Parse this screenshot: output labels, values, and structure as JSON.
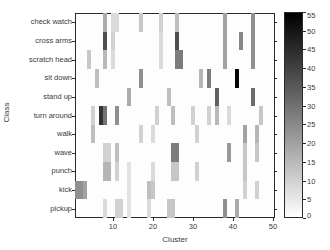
{
  "figure": {
    "xlabel": "Cluster",
    "ylabel": "Class"
  },
  "chart_data": {
    "type": "heatmap",
    "title": "",
    "xlabel": "Cluster",
    "ylabel": "Class",
    "x_range": [
      1,
      50
    ],
    "x_ticks": [
      10,
      20,
      30,
      40,
      50
    ],
    "categories": [
      "check watch",
      "cross arms",
      "scratch head",
      "sit down",
      "stand up",
      "turn around",
      "walk",
      "wave",
      "punch",
      "kick",
      "pickup"
    ],
    "colormap": "grayscale, 0=white, 55=black",
    "colorbar": {
      "min": 0,
      "max": 55,
      "ticks": [
        55,
        50,
        45,
        40,
        35,
        30,
        25,
        20,
        15,
        10,
        5,
        0
      ]
    },
    "cells_format": [
      "class_index",
      "cluster",
      "value"
    ],
    "cells": [
      [
        0,
        8,
        18
      ],
      [
        0,
        10,
        8
      ],
      [
        0,
        11,
        8
      ],
      [
        0,
        17,
        12
      ],
      [
        0,
        22,
        10
      ],
      [
        0,
        26,
        14
      ],
      [
        0,
        38,
        20
      ],
      [
        0,
        45,
        24
      ],
      [
        1,
        8,
        38
      ],
      [
        1,
        10,
        10
      ],
      [
        1,
        22,
        8
      ],
      [
        1,
        26,
        38
      ],
      [
        1,
        38,
        20
      ],
      [
        1,
        42,
        26
      ],
      [
        1,
        45,
        24
      ],
      [
        2,
        4,
        12
      ],
      [
        2,
        8,
        15
      ],
      [
        2,
        10,
        8
      ],
      [
        2,
        22,
        8
      ],
      [
        2,
        26,
        28
      ],
      [
        2,
        27,
        28
      ],
      [
        2,
        38,
        20
      ],
      [
        2,
        45,
        24
      ],
      [
        3,
        6,
        14
      ],
      [
        3,
        17,
        24
      ],
      [
        3,
        32,
        16
      ],
      [
        3,
        34,
        28
      ],
      [
        3,
        41,
        54
      ],
      [
        4,
        14,
        18
      ],
      [
        4,
        24,
        14
      ],
      [
        4,
        36,
        34
      ],
      [
        4,
        45,
        32
      ],
      [
        5,
        5,
        10
      ],
      [
        5,
        7,
        44
      ],
      [
        5,
        8,
        30
      ],
      [
        5,
        11,
        24
      ],
      [
        5,
        21,
        10
      ],
      [
        5,
        25,
        14
      ],
      [
        5,
        30,
        10
      ],
      [
        5,
        34,
        10
      ],
      [
        5,
        36,
        15
      ],
      [
        5,
        39,
        8
      ],
      [
        5,
        47,
        12
      ],
      [
        6,
        5,
        14
      ],
      [
        6,
        17,
        10
      ],
      [
        6,
        20,
        8
      ],
      [
        6,
        31,
        10
      ],
      [
        6,
        43,
        20
      ],
      [
        6,
        46,
        16
      ],
      [
        7,
        8,
        10
      ],
      [
        7,
        9,
        10
      ],
      [
        7,
        11,
        14
      ],
      [
        7,
        25,
        28
      ],
      [
        7,
        26,
        28
      ],
      [
        7,
        39,
        22
      ],
      [
        7,
        43,
        12
      ],
      [
        7,
        46,
        12
      ],
      [
        8,
        8,
        16
      ],
      [
        8,
        9,
        16
      ],
      [
        8,
        11,
        10
      ],
      [
        8,
        14,
        6
      ],
      [
        8,
        20,
        8
      ],
      [
        8,
        25,
        12
      ],
      [
        8,
        26,
        12
      ],
      [
        8,
        31,
        10
      ],
      [
        8,
        43,
        12
      ],
      [
        9,
        1,
        24
      ],
      [
        9,
        2,
        24
      ],
      [
        9,
        3,
        20
      ],
      [
        9,
        14,
        6
      ],
      [
        9,
        19,
        14
      ],
      [
        9,
        20,
        12
      ],
      [
        9,
        43,
        10
      ],
      [
        9,
        46,
        10
      ],
      [
        10,
        8,
        8
      ],
      [
        10,
        11,
        10
      ],
      [
        10,
        12,
        10
      ],
      [
        10,
        14,
        6
      ],
      [
        10,
        19,
        8
      ],
      [
        10,
        24,
        12
      ],
      [
        10,
        25,
        12
      ],
      [
        10,
        38,
        24
      ],
      [
        10,
        41,
        18
      ]
    ]
  },
  "layout": {
    "plot": {
      "left": 75,
      "top": 13,
      "width": 200,
      "height": 205
    },
    "colorbar_px": {
      "left": 284,
      "top": 12,
      "width": 19,
      "height": 206
    }
  }
}
